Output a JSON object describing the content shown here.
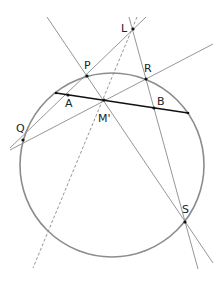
{
  "diagram": {
    "title": "",
    "colors": {
      "circle": "#8c8c8c",
      "line": "#8a8a8a",
      "chord": "#111111",
      "point": "#111111",
      "label": "#222222"
    },
    "circle": {
      "cx": 112,
      "cy": 165,
      "r": 92
    },
    "chord": {
      "x1": 56,
      "y1": 93,
      "x2": 188,
      "y2": 113
    },
    "lines": [
      {
        "id": "line-PS",
        "x1": 47,
        "y1": 17,
        "x2": 213,
        "y2": 263,
        "style": "solid"
      },
      {
        "id": "line-QL",
        "x1": 10,
        "y1": 148,
        "x2": 146,
        "y2": 17,
        "style": "solid"
      },
      {
        "id": "line-QR",
        "x1": 10,
        "y1": 150,
        "x2": 213,
        "y2": 44,
        "style": "solid"
      },
      {
        "id": "line-LS",
        "x1": 129,
        "y1": 17,
        "x2": 198,
        "y2": 269,
        "style": "solid"
      },
      {
        "id": "line-LM-dashed",
        "x1": 137,
        "y1": 17,
        "x2": 33,
        "y2": 268,
        "style": "dashed"
      }
    ],
    "points": [
      {
        "name": "L",
        "x": 133,
        "y": 29,
        "label": "L",
        "lx": 121,
        "ly": 32
      },
      {
        "name": "P",
        "x": 87,
        "y": 76,
        "label": "P",
        "lx": 84,
        "ly": 69
      },
      {
        "name": "R",
        "x": 146,
        "y": 79,
        "label": "R",
        "lx": 144,
        "ly": 72
      },
      {
        "name": "A",
        "x": 68,
        "y": 95,
        "label": "A",
        "lx": 65,
        "ly": 107
      },
      {
        "name": "M'",
        "x": 104,
        "y": 100,
        "label": "M'",
        "lx": 98,
        "ly": 122
      },
      {
        "name": "B",
        "x": 154,
        "y": 108,
        "label": "B",
        "lx": 157,
        "ly": 105
      },
      {
        "name": "Q",
        "x": 23,
        "y": 140,
        "label": "Q",
        "lx": 16,
        "ly": 132
      },
      {
        "name": "S",
        "x": 185,
        "y": 222,
        "label": "S",
        "lx": 182,
        "ly": 213
      }
    ]
  }
}
